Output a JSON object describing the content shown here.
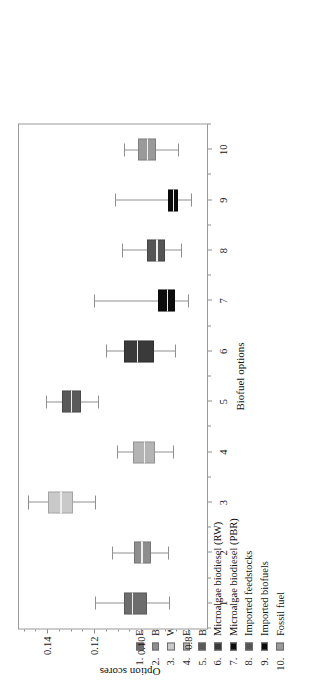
{
  "figure": {
    "orientation": "rotated-90-ccw"
  },
  "legend": {
    "entries": [
      {
        "num": "1.",
        "label": "Ethanol 1G",
        "color": "#6d6d6d"
      },
      {
        "num": "2.",
        "label": "Biodiesel 1G",
        "color": "#8e8e8e"
      },
      {
        "num": "3.",
        "label": "Waste-based biodiesels",
        "color": "#c9c9c9"
      },
      {
        "num": "4.",
        "label": "Ethanol 2G",
        "color": "#b4b4b4"
      },
      {
        "num": "5.",
        "label": "Biodiesel 2G",
        "color": "#5a5a5a"
      },
      {
        "num": "6.",
        "label": "Microalgae biodiesel (RW)",
        "color": "#3a3a3a"
      },
      {
        "num": "7.",
        "label": "Microalgae biodiesel (PBR)",
        "color": "#0d0d0d"
      },
      {
        "num": "8.",
        "label": "Imported feedstocks",
        "color": "#555555"
      },
      {
        "num": "9.",
        "label": "Imported biofuels",
        "color": "#0a0a0a"
      },
      {
        "num": "10.",
        "label": "Fossil fuel",
        "color": "#9a9a9a"
      }
    ]
  },
  "chart_data": {
    "type": "boxplot",
    "title": "",
    "xlabel": "Biofuel options",
    "ylabel": "Option scores",
    "xticks": [
      "1",
      "2",
      "3",
      "4",
      "5",
      "6",
      "7",
      "8",
      "9",
      "10"
    ],
    "yticks": [
      "0.14",
      "0.12",
      "0.10",
      "0.8"
    ],
    "ytick_values": [
      0.14,
      0.12,
      0.1,
      0.08
    ],
    "ylim": [
      0.072,
      0.152
    ],
    "grid": false,
    "legend_position": "top",
    "categories": [
      "Ethanol 1G",
      "Biodiesel 1G",
      "Waste-based biodiesels",
      "Ethanol 2G",
      "Biodiesel 2G",
      "Microalgae biodiesel (RW)",
      "Microalgae biodiesel (PBR)",
      "Imported feedstocks",
      "Imported biofuels",
      "Fossil fuel"
    ],
    "boxes": [
      {
        "x": 1,
        "label": "Ethanol 1G",
        "min": 0.088,
        "q1": 0.0975,
        "median": 0.104,
        "q3": 0.1075,
        "max": 0.1195,
        "color": "#6d6d6d"
      },
      {
        "x": 2,
        "label": "Biodiesel 1G",
        "min": 0.0885,
        "q1": 0.096,
        "median": 0.1,
        "q3": 0.103,
        "max": 0.1125,
        "color": "#8e8e8e"
      },
      {
        "x": 3,
        "label": "Waste-based biodiesels",
        "min": 0.1195,
        "q1": 0.129,
        "median": 0.1345,
        "q3": 0.1395,
        "max": 0.148,
        "color": "#c9c9c9"
      },
      {
        "x": 4,
        "label": "Ethanol 2G",
        "min": 0.0865,
        "q1": 0.094,
        "median": 0.099,
        "q3": 0.1035,
        "max": 0.1105,
        "color": "#b4b4b4"
      },
      {
        "x": 5,
        "label": "Biodiesel 2G",
        "min": 0.1185,
        "q1": 0.1255,
        "median": 0.13,
        "q3": 0.1335,
        "max": 0.1405,
        "color": "#5a5a5a"
      },
      {
        "x": 6,
        "label": "Microalgae biodiesel (RW)",
        "min": 0.0855,
        "q1": 0.0945,
        "median": 0.102,
        "q3": 0.1075,
        "max": 0.115,
        "color": "#3a3a3a"
      },
      {
        "x": 7,
        "label": "Microalgae biodiesel (PBR)",
        "min": 0.08,
        "q1": 0.0855,
        "median": 0.089,
        "q3": 0.093,
        "max": 0.12,
        "color": "#0d0d0d"
      },
      {
        "x": 8,
        "label": "Imported feedstocks",
        "min": 0.083,
        "q1": 0.09,
        "median": 0.0935,
        "q3": 0.0975,
        "max": 0.108,
        "color": "#555555"
      },
      {
        "x": 9,
        "label": "Imported biofuels",
        "min": 0.079,
        "q1": 0.0845,
        "median": 0.0865,
        "q3": 0.0885,
        "max": 0.111,
        "color": "#0a0a0a"
      },
      {
        "x": 10,
        "label": "Fossil fuel",
        "min": 0.0845,
        "q1": 0.0935,
        "median": 0.0975,
        "q3": 0.1015,
        "max": 0.1075,
        "color": "#9a9a9a"
      }
    ]
  }
}
